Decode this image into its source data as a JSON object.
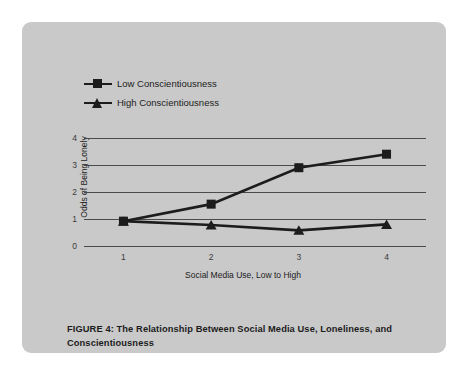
{
  "chart_data": {
    "type": "line",
    "title": "",
    "xlabel": "Social Media Use, Low to High",
    "ylabel": "Odds of Being Lonely",
    "x": [
      1,
      2,
      3,
      4
    ],
    "xticklabels": [
      "1",
      "2",
      "3",
      "4"
    ],
    "yticklabels": [
      "0",
      "1",
      "2",
      "3",
      "4"
    ],
    "xlim": [
      0.55,
      4.45
    ],
    "ylim": [
      0,
      4
    ],
    "grid": "horizontal",
    "legend_position": "top-left-outside",
    "series": [
      {
        "name": "Low Conscientiousness",
        "marker": "square",
        "color": "#1c1c1c",
        "values": [
          0.92,
          1.55,
          2.9,
          3.4
        ]
      },
      {
        "name": "High Conscientiousness",
        "marker": "triangle",
        "color": "#1c1c1c",
        "values": [
          0.92,
          0.78,
          0.58,
          0.8
        ]
      }
    ]
  },
  "legend": {
    "items": [
      {
        "label": "Low Conscientiousness",
        "marker": "square"
      },
      {
        "label": "High Conscientiousness",
        "marker": "triangle"
      }
    ]
  },
  "axes": {
    "x_title": "Social Media Use, Low to High",
    "y_title": "Odds of Being Lonely"
  },
  "caption": {
    "text": "FIGURE 4: The Relationship Between Social Media Use, Loneliness, and Conscientiousness"
  },
  "colors": {
    "card_background": "#c9c9c9",
    "page_background": "#ffffff",
    "ink": "#1c1c1c",
    "gridline": "#4a4a4a"
  }
}
